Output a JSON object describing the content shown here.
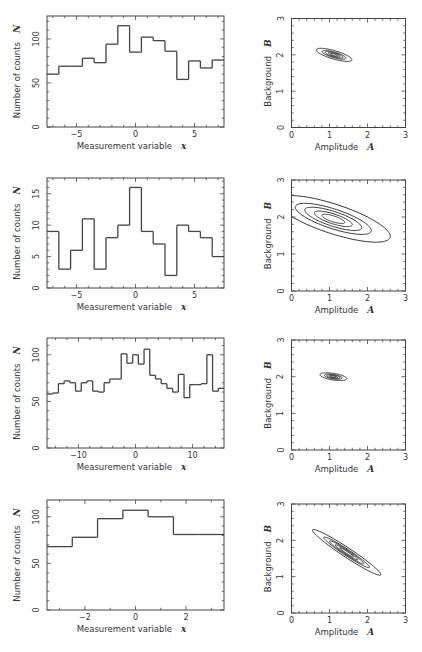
{
  "chart_data": [
    {
      "type": "histogram",
      "panel": "row-1-left",
      "xlabel": "Measurement variable",
      "xlabel_symbol": "x",
      "ylabel": "Number of counts",
      "ylabel_symbol": "N",
      "xlim": [
        -7.5,
        7.5
      ],
      "ylim": [
        0,
        126
      ],
      "xticks": [
        -5,
        0,
        5
      ],
      "xtick_labels": [
        "−5",
        "0",
        "5"
      ],
      "xminor_step": 1,
      "yticks": [
        0,
        50,
        100
      ],
      "ytick_labels": [
        "0",
        "50",
        "100"
      ],
      "yminor_step": 10,
      "bin_edges": [
        -7.5,
        -6.5,
        -5.5,
        -4.5,
        -3.5,
        -2.5,
        -1.5,
        -0.5,
        0.5,
        1.5,
        2.5,
        3.5,
        4.5,
        5.5,
        6.5,
        7.5
      ],
      "counts": [
        60,
        69,
        69,
        78,
        73,
        94,
        115,
        85,
        102,
        98,
        86,
        54,
        75,
        67,
        76
      ]
    },
    {
      "type": "contour",
      "panel": "row-1-right",
      "xlabel": "Amplitude",
      "xlabel_symbol": "A",
      "ylabel": "Background",
      "ylabel_symbol": "B",
      "xlim": [
        0,
        3
      ],
      "ylim": [
        0,
        3
      ],
      "xticks": [
        0,
        1,
        2,
        3
      ],
      "yticks": [
        0,
        1,
        2,
        3
      ],
      "minor_step": 0.2,
      "center": [
        1.12,
        2.0
      ],
      "sigma": [
        0.157,
        0.06
      ],
      "rho": -0.75,
      "levels_sigma": [
        0.6,
        1,
        1.5,
        2,
        3
      ]
    },
    {
      "type": "histogram",
      "panel": "row-2-left",
      "xlabel": "Measurement variable",
      "xlabel_symbol": "x",
      "ylabel": "Number of counts",
      "ylabel_symbol": "N",
      "xlim": [
        -7.5,
        7.5
      ],
      "ylim": [
        0,
        17.5
      ],
      "xticks": [
        -5,
        0,
        5
      ],
      "xtick_labels": [
        "−5",
        "0",
        "5"
      ],
      "xminor_step": 1,
      "yticks": [
        0,
        5,
        10,
        15
      ],
      "ytick_labels": [
        "0",
        "5",
        "10",
        "15"
      ],
      "yminor_step": 1,
      "bin_edges": [
        -7.5,
        -6.5,
        -5.5,
        -4.5,
        -3.5,
        -2.5,
        -1.5,
        -0.5,
        0.5,
        1.5,
        2.5,
        3.5,
        4.5,
        5.5,
        6.5,
        7.5
      ],
      "counts": [
        9,
        3,
        6,
        11,
        3,
        8,
        10,
        16,
        9,
        7,
        2,
        10,
        9,
        8,
        5
      ]
    },
    {
      "type": "contour",
      "panel": "row-2-right",
      "xlabel": "Amplitude",
      "xlabel_symbol": "A",
      "ylabel": "Background",
      "ylabel_symbol": "B",
      "xlim": [
        0,
        3
      ],
      "ylim": [
        0,
        3
      ],
      "xticks": [
        0,
        1,
        2,
        3
      ],
      "yticks": [
        0,
        1,
        2,
        3
      ],
      "minor_step": 0.2,
      "center": [
        1.1,
        1.95
      ],
      "sigma": [
        0.5,
        0.21
      ],
      "rho": -0.75,
      "levels_sigma": [
        0.6,
        1,
        1.5,
        2,
        3
      ]
    },
    {
      "type": "histogram",
      "panel": "row-3-left",
      "xlabel": "Measurement variable",
      "xlabel_symbol": "x",
      "ylabel": "Number of counts",
      "ylabel_symbol": "N",
      "xlim": [
        -15.5,
        15.5
      ],
      "ylim": [
        0,
        118
      ],
      "xticks": [
        -10,
        0,
        10
      ],
      "xtick_labels": [
        "−10",
        "0",
        "10"
      ],
      "xminor_step": 2,
      "yticks": [
        0,
        50,
        100
      ],
      "ytick_labels": [
        "0",
        "50",
        "100"
      ],
      "yminor_step": 10,
      "bin_edges": [
        -15.5,
        -14.5,
        -13.5,
        -12.5,
        -11.5,
        -10.5,
        -9.5,
        -8.5,
        -7.5,
        -6.5,
        -5.5,
        -4.5,
        -3.5,
        -2.5,
        -1.5,
        -0.5,
        0.5,
        1.5,
        2.5,
        3.5,
        4.5,
        5.5,
        6.5,
        7.5,
        8.5,
        9.5,
        10.5,
        11.5,
        12.5,
        13.5,
        14.5,
        15.5
      ],
      "counts": [
        58,
        59,
        69,
        72,
        70,
        61,
        70,
        72,
        61,
        60,
        70,
        74,
        74,
        101,
        91,
        100,
        90,
        106,
        78,
        74,
        69,
        64,
        60,
        79,
        54,
        68,
        68,
        69,
        100,
        61,
        64
      ]
    },
    {
      "type": "contour",
      "panel": "row-3-right",
      "xlabel": "Amplitude",
      "xlabel_symbol": "A",
      "ylabel": "Background",
      "ylabel_symbol": "B",
      "xlim": [
        0,
        3
      ],
      "ylim": [
        0,
        3
      ],
      "xticks": [
        0,
        1,
        2,
        3
      ],
      "yticks": [
        0,
        1,
        2,
        3
      ],
      "minor_step": 0.2,
      "center": [
        1.1,
        2.0
      ],
      "sigma": [
        0.117,
        0.035
      ],
      "rho": -0.5,
      "levels_sigma": [
        0.6,
        1,
        1.5,
        2,
        3
      ]
    },
    {
      "type": "histogram",
      "panel": "row-4-left",
      "xlabel": "Measurement variable",
      "xlabel_symbol": "x",
      "ylabel": "Number of counts",
      "ylabel_symbol": "N",
      "xlim": [
        -3.5,
        3.5
      ],
      "ylim": [
        0,
        118
      ],
      "xticks": [
        -2,
        0,
        2
      ],
      "xtick_labels": [
        "−2",
        "0",
        "2"
      ],
      "xminor_step": 1,
      "yticks": [
        0,
        50,
        100
      ],
      "ytick_labels": [
        "0",
        "50",
        "100"
      ],
      "yminor_step": 10,
      "bin_edges": [
        -3.5,
        -2.5,
        -1.5,
        -0.5,
        0.5,
        1.5,
        2.5,
        3.5
      ],
      "counts": [
        68,
        78,
        98,
        107,
        100,
        81,
        81
      ]
    },
    {
      "type": "contour",
      "panel": "row-4-right",
      "xlabel": "Amplitude",
      "xlabel_symbol": "A",
      "ylabel": "Background",
      "ylabel_symbol": "B",
      "xlim": [
        0,
        3
      ],
      "ylim": [
        0,
        3
      ],
      "xticks": [
        0,
        1,
        2,
        3
      ],
      "yticks": [
        0,
        1,
        2,
        3
      ],
      "minor_step": 0.2,
      "center": [
        1.45,
        1.67
      ],
      "sigma": [
        0.3,
        0.21
      ],
      "rho": -0.97,
      "levels_sigma": [
        0.6,
        1,
        1.5,
        2,
        3
      ]
    }
  ]
}
